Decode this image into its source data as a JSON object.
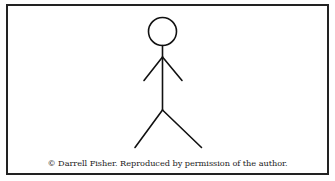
{
  "figure": {
    "type": "stick-figure",
    "stroke_color": "#111111",
    "frame_color": "#222222",
    "background": "#ffffff"
  },
  "caption": {
    "text": "© Darrell Fisher. Reproduced by permission of the author."
  }
}
